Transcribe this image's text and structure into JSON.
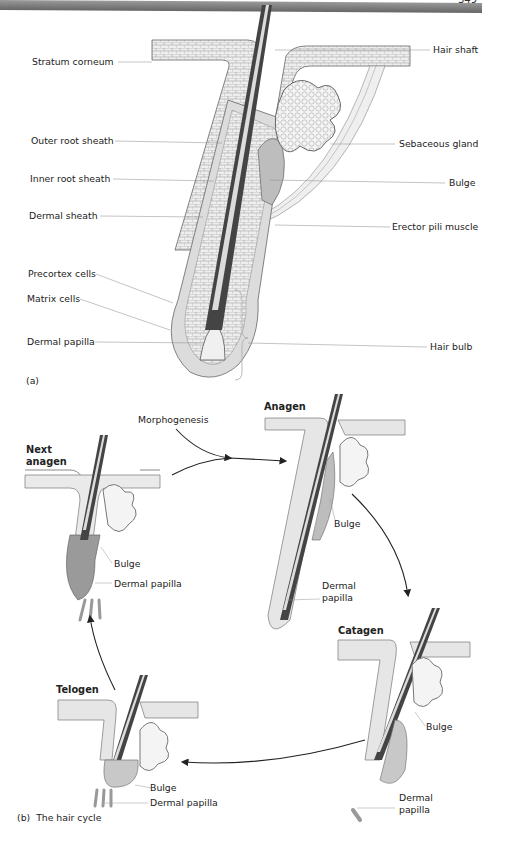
{
  "page": {
    "number_fragment": "349"
  },
  "figure_a": {
    "panel_label": "(a)",
    "labels_left": [
      "Stratum corneum",
      "Outer root sheath",
      "Inner root sheath",
      "Dermal sheath",
      "Precortex cells",
      "Matrix cells",
      "Dermal papilla"
    ],
    "labels_right": [
      "Hair shaft",
      "Sebaceous gland",
      "Bulge",
      "Erector pili muscle",
      "Hair bulb"
    ]
  },
  "figure_b": {
    "panel_label": "(b)",
    "caption": "The hair cycle",
    "morphogenesis": "Morphogenesis",
    "stages": {
      "anagen": {
        "title": "Anagen",
        "bulge": "Bulge",
        "dermal_papilla_line1": "Dermal",
        "dermal_papilla_line2": "papilla"
      },
      "catagen": {
        "title": "Catagen",
        "bulge": "Bulge",
        "dermal_papilla_line1": "Dermal",
        "dermal_papilla_line2": "papilla"
      },
      "telogen": {
        "title": "Telogen",
        "bulge": "Bulge",
        "dermal_papilla": "Dermal papilla"
      },
      "next_anagen": {
        "title_line1": "Next",
        "title_line2": "anagen",
        "bulge": "Bulge",
        "dermal_papilla": "Dermal papilla"
      }
    }
  },
  "colors": {
    "hair_dark": "#3a3a3a",
    "sheath_gray": "#c8c8c8",
    "skin_light": "#e6e6e6",
    "line": "#555555"
  }
}
